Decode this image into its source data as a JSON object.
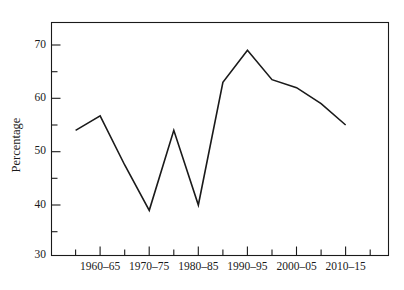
{
  "chart_data": {
    "type": "line",
    "title": "",
    "subtitle": "",
    "xlabel": "",
    "ylabel": "Percentage",
    "ylim": [
      30,
      73
    ],
    "xlim": [
      0,
      16
    ],
    "grid": false,
    "legend": null,
    "y_ticks_major": [
      30,
      40,
      50,
      60,
      70
    ],
    "y_ticks_major_labels": [
      "30",
      "40",
      "50",
      "60",
      "70"
    ],
    "y_ticks_minor": [
      35,
      45,
      55,
      65
    ],
    "x_ticks_labeled": [
      "1960–65",
      "1970–75",
      "1980–85",
      "1990–95",
      "2000–05",
      "2010–15"
    ],
    "x_tick_positions_labeled": [
      2,
      4,
      6,
      8,
      10,
      12
    ],
    "x_ticks_unlabeled_positions": [
      1,
      3,
      5,
      7,
      9,
      11,
      13
    ],
    "categories": [
      "1955–60",
      "1960–65",
      "1965–70",
      "1970–75",
      "1975–80",
      "1980–85",
      "1985–90",
      "1990–95",
      "1995–00",
      "2000–05",
      "2005–10",
      "2010–15"
    ],
    "x": [
      1,
      2,
      3,
      4,
      5,
      6,
      7,
      8,
      9,
      10,
      11,
      12
    ],
    "values": [
      54,
      56.7,
      47.5,
      39,
      54,
      40,
      63,
      69,
      63.5,
      62,
      59,
      55
    ],
    "series": [
      {
        "name": "Percentage",
        "values": [
          54,
          56.7,
          47.5,
          39,
          54,
          40,
          63,
          69,
          63.5,
          62,
          59,
          55
        ],
        "color": "#1a1a1a"
      }
    ],
    "annotations": []
  },
  "figure": {
    "background_color": "#ffffff",
    "line_color": "#1a1a1a",
    "axis_color": "#1a1a1a"
  }
}
